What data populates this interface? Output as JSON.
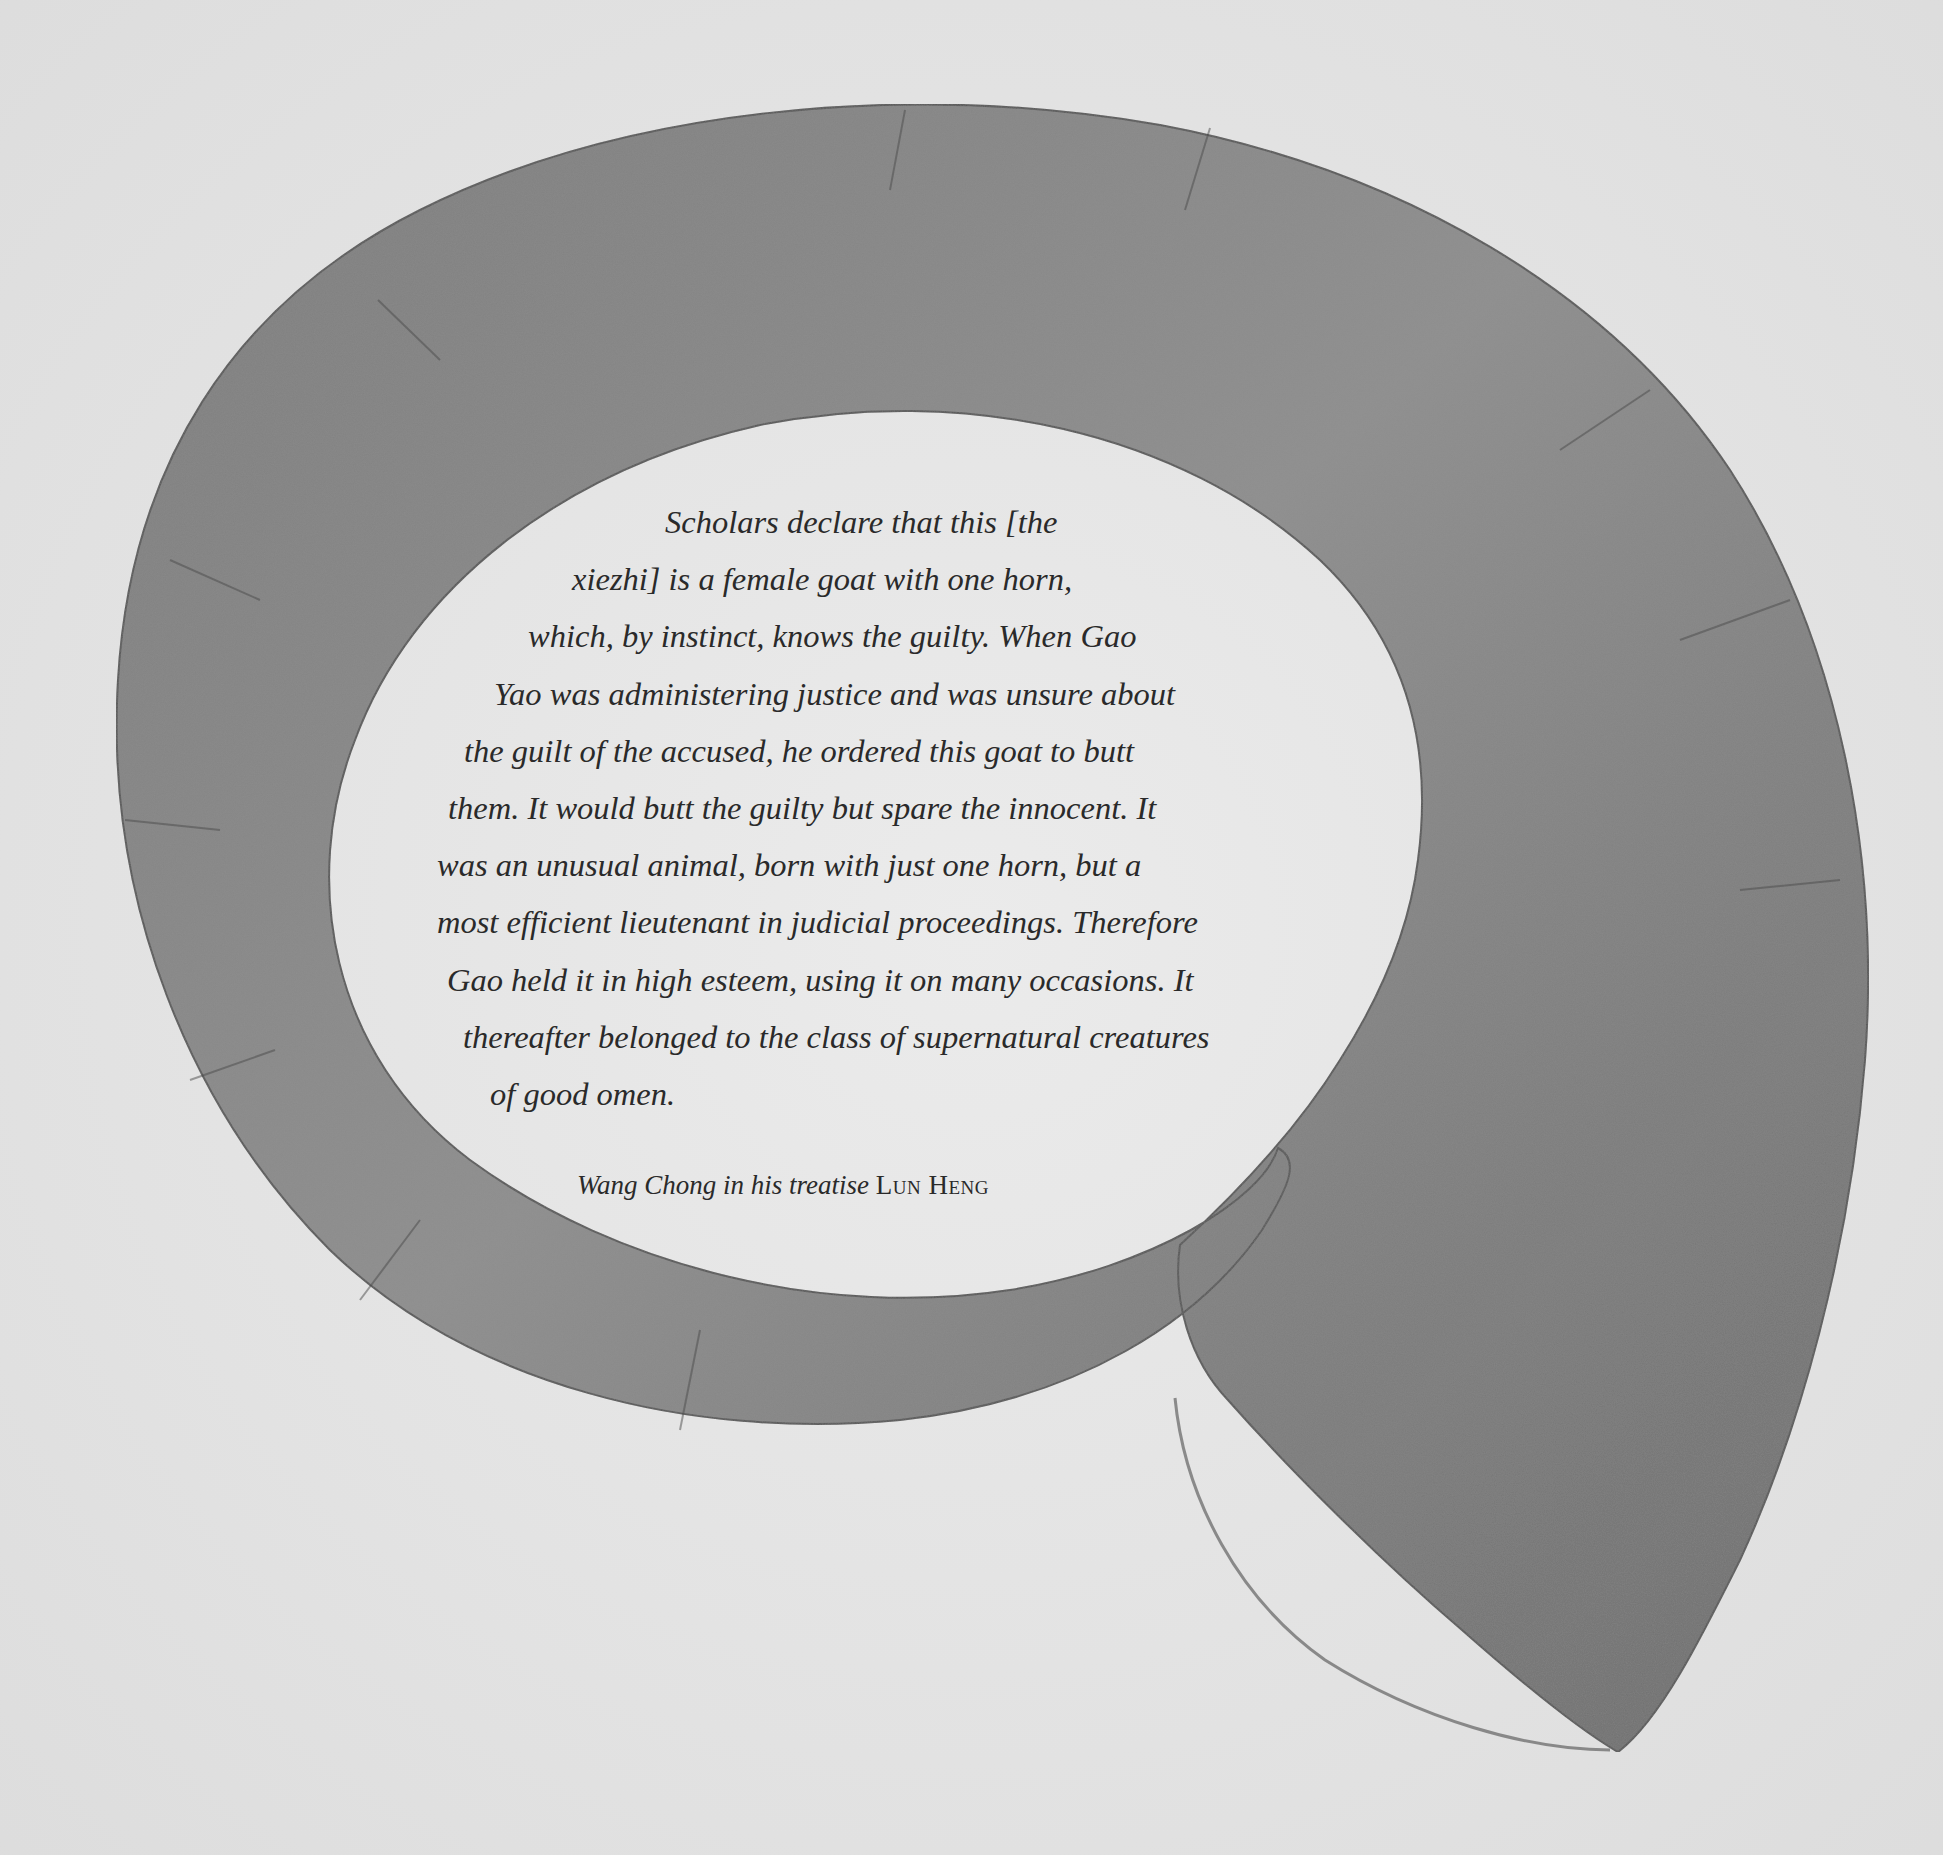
{
  "illustration": {
    "subject": "spiral single horn (xiezhi)",
    "colors": {
      "paper": "#e4e4e4",
      "horn_mid": "#8a8a8a",
      "horn_dark": "#5f5f5f",
      "text": "#2a2a2a"
    }
  },
  "quote": {
    "lines": [
      "Scholars declare that this [the",
      "xiezhi] is a female goat with one horn,",
      "which, by instinct, knows the guilty. When Gao",
      "Yao was administering justice and was unsure about",
      "the guilt of the accused, he ordered this goat to butt",
      "them. It would butt the guilty but spare the innocent. It",
      "was an unusual animal, born with just one horn, but a",
      "most efficient lieutenant in judicial proceedings. Therefore",
      "Gao held it in high esteem, using it on many occasions. It",
      "thereafter belonged to the class of supernatural creatures",
      "of good omen."
    ]
  },
  "attribution": {
    "author_text": "Wang Chong in his treatise",
    "work_title": "Lun Heng"
  }
}
